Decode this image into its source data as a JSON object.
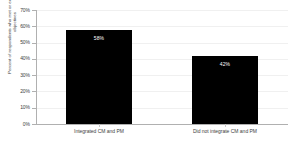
{
  "chart_data": {
    "type": "bar",
    "title": "",
    "xlabel": "",
    "ylabel": "Percent of respondents who met or exceeded project objectives",
    "categories": [
      "Integrated CM and PM",
      "Did not integrate CM and PM"
    ],
    "values": [
      58,
      42
    ],
    "value_labels": [
      "58%",
      "42%"
    ],
    "ylim": [
      0,
      70
    ],
    "yticks": [
      0,
      10,
      20,
      30,
      40,
      50,
      60,
      70
    ],
    "ytick_labels": [
      "0%",
      "10%",
      "20%",
      "30%",
      "40%",
      "50%",
      "60%",
      "70%"
    ],
    "grid": true,
    "legend": "none",
    "bar_color": "#000000",
    "value_label_color": "#ffffff",
    "axis_color": "#b0b0b0",
    "gridline_color": "#f0f0f0",
    "text_color": "#3d3d3d",
    "background_color": "#ffffff"
  }
}
